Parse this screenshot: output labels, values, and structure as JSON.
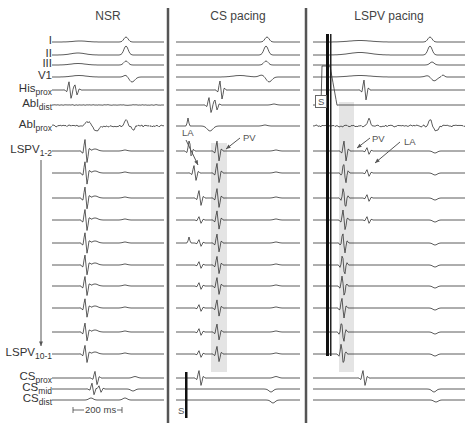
{
  "figure": {
    "panels": [
      {
        "id": "nsr",
        "title": "NSR",
        "x0": 52,
        "x1": 164
      },
      {
        "id": "cs",
        "title": "CS pacing",
        "x0": 176,
        "x1": 300
      },
      {
        "id": "lspv",
        "title": "LSPV pacing",
        "x0": 313,
        "x1": 465
      }
    ],
    "dividers_x": [
      168,
      306
    ],
    "leads": [
      {
        "id": "I",
        "main": "I",
        "sub": "",
        "y": 42
      },
      {
        "id": "II",
        "main": "II",
        "sub": "",
        "y": 55
      },
      {
        "id": "III",
        "main": "III",
        "sub": "",
        "y": 65
      },
      {
        "id": "V1",
        "main": "V1",
        "sub": "",
        "y": 77
      },
      {
        "id": "His_prox",
        "main": "His",
        "sub": "prox",
        "y": 90
      },
      {
        "id": "Abl_dist",
        "main": "Abl",
        "sub": "dist",
        "y": 105
      },
      {
        "id": "Abl_prox",
        "main": "Abl",
        "sub": "prox",
        "y": 126
      },
      {
        "id": "LSPV_1_2",
        "main": "LSPV",
        "sub": "1-2",
        "y": 151
      },
      {
        "id": "LSPV_2",
        "main": "",
        "sub": "",
        "y": 173
      },
      {
        "id": "LSPV_3",
        "main": "",
        "sub": "",
        "y": 198
      },
      {
        "id": "LSPV_4",
        "main": "",
        "sub": "",
        "y": 220
      },
      {
        "id": "LSPV_5",
        "main": "",
        "sub": "",
        "y": 243
      },
      {
        "id": "LSPV_6",
        "main": "",
        "sub": "",
        "y": 265
      },
      {
        "id": "LSPV_7",
        "main": "",
        "sub": "",
        "y": 286
      },
      {
        "id": "LSPV_8",
        "main": "",
        "sub": "",
        "y": 308
      },
      {
        "id": "LSPV_9",
        "main": "",
        "sub": "",
        "y": 332
      },
      {
        "id": "LSPV_10_1",
        "main": "LSPV",
        "sub": "10-1",
        "y": 354
      },
      {
        "id": "CS_prox",
        "main": "CS",
        "sub": "prox",
        "y": 378
      },
      {
        "id": "CS_mid",
        "main": "CS",
        "sub": "mid",
        "y": 389
      },
      {
        "id": "CS_dist",
        "main": "CS",
        "sub": "dist",
        "y": 400
      }
    ],
    "annotations": {
      "cs_la": "LA",
      "cs_pv": "PV",
      "cs_stim": "S",
      "lspv_pv": "PV",
      "lspv_la": "LA",
      "lspv_stim": "S"
    },
    "scale_bar": {
      "label": "200 ms",
      "x0": 73,
      "x1": 122,
      "y": 410
    },
    "shaded_regions": [
      {
        "panel": "cs",
        "x": 211,
        "width": 16,
        "y0": 143,
        "y1": 372
      },
      {
        "panel": "lspv",
        "x": 339,
        "width": 15,
        "y0": 102,
        "y1": 372
      }
    ],
    "colors": {
      "trace": "#333333",
      "divider": "#555555",
      "shade": "#e4e4e4",
      "arrow": "#555555"
    }
  }
}
